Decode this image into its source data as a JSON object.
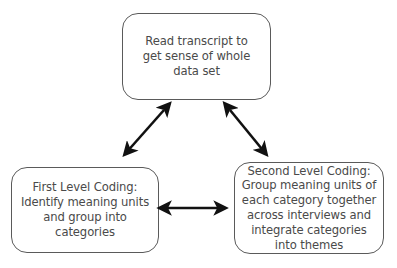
{
  "diagram": {
    "type": "cycle",
    "nodes": [
      {
        "id": "read",
        "label": "Read transcript to\nget sense of whole\ndata set"
      },
      {
        "id": "first",
        "label": "First Level Coding:\nIdentify meaning units\nand group into\ncategories"
      },
      {
        "id": "second",
        "label": "Second Level Coding:\nGroup meaning units of\neach category together\nacross interviews and\nintegrate categories\ninto themes"
      }
    ],
    "edges": [
      {
        "from": "read",
        "to": "first",
        "direction": "bidirectional"
      },
      {
        "from": "read",
        "to": "second",
        "direction": "bidirectional"
      },
      {
        "from": "first",
        "to": "second",
        "direction": "bidirectional"
      }
    ],
    "colors": {
      "border": "#5a5a5a",
      "text": "#4a4a4a",
      "arrow": "#111111"
    }
  }
}
